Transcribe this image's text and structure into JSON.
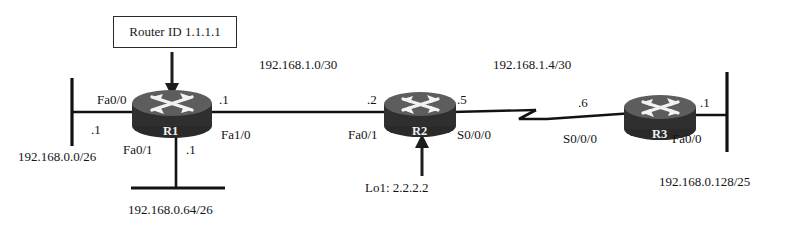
{
  "diagram": {
    "title_box": {
      "label": "Router ID 1.1.1.1"
    },
    "routers": [
      {
        "id": "r1",
        "name": "R1"
      },
      {
        "id": "r2",
        "name": "R2"
      },
      {
        "id": "r3",
        "name": "R3"
      }
    ],
    "links": [
      {
        "id": "r1-r2",
        "subnet": "192.168.1.0/30",
        "type": "ethernet"
      },
      {
        "id": "r2-r3",
        "subnet": "192.168.1.4/30",
        "type": "serial"
      }
    ],
    "interfaces": {
      "r1_fa00_name": "Fa0/0",
      "r1_fa00_addr": ".1",
      "r1_fa10_name": "Fa1/0",
      "r1_fa10_addr": ".1",
      "r1_fa01_name": "Fa0/1",
      "r1_fa01_addr": ".1",
      "r2_fa01_name": "Fa0/1",
      "r2_fa01_addr": ".2",
      "r2_s000_name": "S0/0/0",
      "r2_s000_addr": ".5",
      "r3_s000_name": "S0/0/0",
      "r3_s000_addr": ".6",
      "r3_fa00_name": "Fa0/0",
      "r3_fa00_addr": ".1"
    },
    "lans": [
      {
        "id": "lan-left",
        "subnet": "192.168.0.0/26"
      },
      {
        "id": "lan-bottom",
        "subnet": "192.168.0.64/26"
      },
      {
        "id": "lan-right",
        "subnet": "192.168.0.128/25"
      }
    ],
    "loopback": {
      "label": "Lo1:  2.2.2.2"
    },
    "colors": {
      "line": "#121212",
      "router_body": "#585858",
      "router_base": "#2a2a2a",
      "text": "#141414"
    }
  }
}
